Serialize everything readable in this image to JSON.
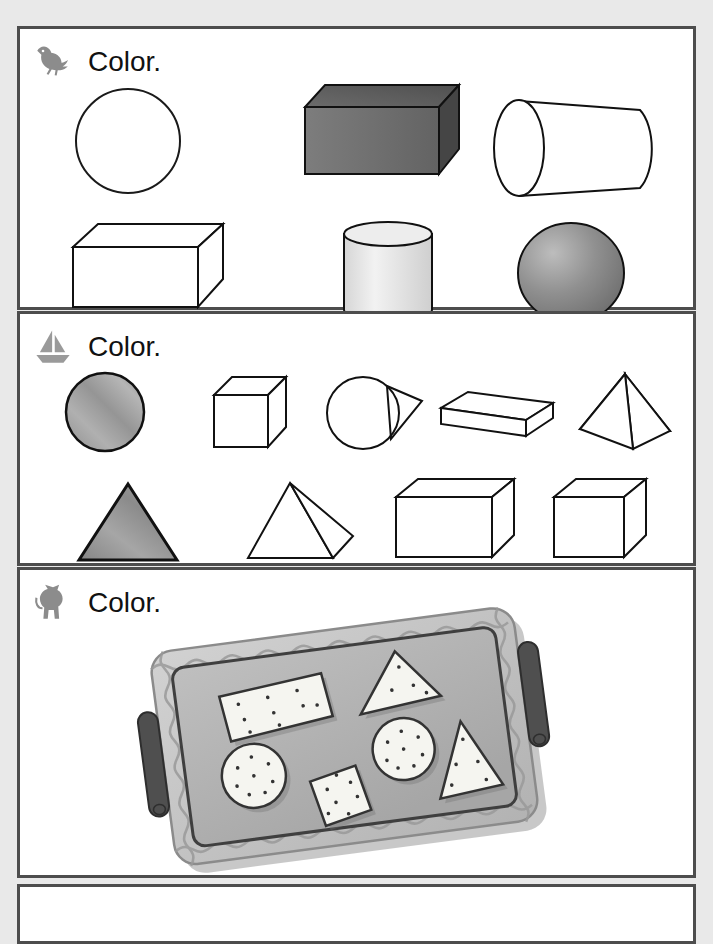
{
  "page": {
    "background_color": "#e9e9e9",
    "panel_background": "#ffffff",
    "panel_border_color": "#4d4d4d",
    "width": 713,
    "height": 905
  },
  "sections": [
    {
      "id": "section-1",
      "icon_name": "bird-icon",
      "icon_color": "#8c8c8c",
      "instruction": "Color.",
      "shapes": [
        {
          "name": "sphere-outline-circle",
          "label": "circle",
          "fill": "#ffffff",
          "row": 1
        },
        {
          "name": "shaded-rectangular-prism",
          "label": "rectangular prism",
          "fill": "#707070",
          "row": 1
        },
        {
          "name": "cylinder-horizontal-outline",
          "label": "cylinder",
          "fill": "#ffffff",
          "row": 1
        },
        {
          "name": "rectangular-prism-outline",
          "label": "rectangular prism",
          "fill": "#ffffff",
          "row": 2
        },
        {
          "name": "cylinder-vertical-shaded",
          "label": "cylinder",
          "fill": "#e3e3e3",
          "row": 2
        },
        {
          "name": "sphere-shaded",
          "label": "sphere",
          "fill": "#8a8a8a",
          "row": 2
        }
      ]
    },
    {
      "id": "section-2",
      "icon_name": "sailboat-icon",
      "icon_color": "#9a9a9a",
      "instruction": "Color.",
      "shapes": [
        {
          "name": "circle-colored",
          "label": "circle",
          "fill": "#9e9e9e",
          "row": 1
        },
        {
          "name": "cube-outline",
          "label": "cube",
          "fill": "#ffffff",
          "row": 1
        },
        {
          "name": "cone-outline",
          "label": "cone",
          "fill": "#ffffff",
          "row": 1
        },
        {
          "name": "flat-slab-prism-outline",
          "label": "rectangular prism",
          "fill": "#ffffff",
          "row": 1
        },
        {
          "name": "square-pyramid-outline",
          "label": "pyramid",
          "fill": "#ffffff",
          "row": 1
        },
        {
          "name": "triangle-colored",
          "label": "triangle",
          "fill": "#8f8f8f",
          "row": 2
        },
        {
          "name": "tetrahedron-outline",
          "label": "pyramid",
          "fill": "#ffffff",
          "row": 2
        },
        {
          "name": "rectangular-prism-outline-2",
          "label": "rectangular prism",
          "fill": "#ffffff",
          "row": 2
        },
        {
          "name": "cube-outline-2",
          "label": "cube",
          "fill": "#ffffff",
          "row": 2
        }
      ]
    },
    {
      "id": "section-3",
      "icon_name": "cat-icon",
      "icon_color": "#8c8c8c",
      "instruction": "Color.",
      "illustration": {
        "name": "baking-tray-with-crackers",
        "tray_fill": "#b4b4b4",
        "tray_rim_fill": "#c6c6c6",
        "tray_outline": "#4a4a4a",
        "handle_fill": "#4f4f4f",
        "cracker_fill": "#f5f5f0",
        "cracker_outline": "#3a3a3a",
        "crackers": [
          {
            "name": "cracker-rectangle",
            "label": "rectangle",
            "holes": 9
          },
          {
            "name": "cracker-triangle-top",
            "label": "triangle",
            "holes": 4
          },
          {
            "name": "cracker-circle-left",
            "label": "circle",
            "holes": 8
          },
          {
            "name": "cracker-square",
            "label": "square",
            "holes": 7
          },
          {
            "name": "cracker-circle-right",
            "label": "circle",
            "holes": 8
          },
          {
            "name": "cracker-triangle-bottom",
            "label": "triangle",
            "holes": 5
          }
        ]
      }
    }
  ]
}
